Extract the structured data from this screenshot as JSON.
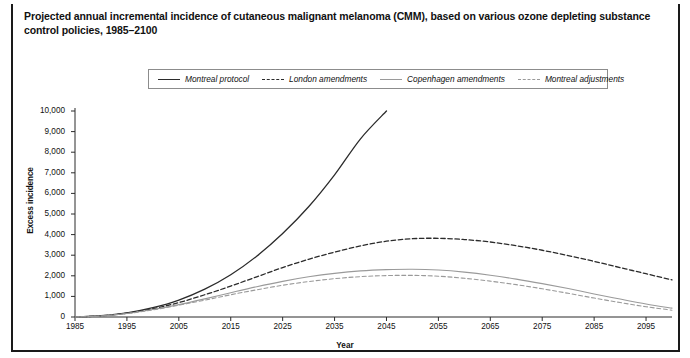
{
  "figure": {
    "title": "Projected annual incremental incidence of cutaneous malignant melanoma (CMM), based on various ozone depleting substance control policies, 1985–2100"
  },
  "chart_data": {
    "type": "line",
    "title": "Projected annual incremental incidence of cutaneous malignant melanoma (CMM), based on various ozone depleting substance control policies, 1985–2100",
    "xlabel": "Year",
    "ylabel": "Excess incidence",
    "xlim": [
      1985,
      2100
    ],
    "ylim": [
      0,
      10000
    ],
    "grid": false,
    "legend_position": "top-center",
    "xticks": [
      1985,
      1995,
      2005,
      2015,
      2025,
      2035,
      2045,
      2055,
      2065,
      2075,
      2085,
      2095
    ],
    "xtick_labels": [
      "1985",
      "1995",
      "2005",
      "2015",
      "2025",
      "2035",
      "2045",
      "2055",
      "2065",
      "2075",
      "2085",
      "2095"
    ],
    "yticks": [
      0,
      1000,
      2000,
      3000,
      4000,
      5000,
      6000,
      7000,
      8000,
      9000,
      10000
    ],
    "ytick_labels": [
      "0",
      "1,000",
      "2,000",
      "3,000",
      "4,000",
      "5,000",
      "6,000",
      "7,000",
      "8,000",
      "9,000",
      "10,000"
    ],
    "x": [
      1985,
      1990,
      1995,
      2000,
      2005,
      2010,
      2015,
      2020,
      2025,
      2030,
      2035,
      2040,
      2045,
      2050,
      2055,
      2060,
      2065,
      2070,
      2075,
      2080,
      2085,
      2090,
      2095,
      2100
    ],
    "series": [
      {
        "name": "Montreal protocol",
        "color": "#2b2b2b",
        "style": "solid",
        "values": [
          0,
          60,
          200,
          450,
          820,
          1350,
          2050,
          2950,
          4050,
          5350,
          6900,
          8650,
          10000,
          null,
          null,
          null,
          null,
          null,
          null,
          null,
          null,
          null,
          null,
          null
        ],
        "note": "rises steeply off-scale, crossing 10,000 near 2042"
      },
      {
        "name": "London amendments",
        "color": "#2b2b2b",
        "style": "dashed",
        "values": [
          0,
          55,
          185,
          400,
          700,
          1080,
          1500,
          1950,
          2400,
          2800,
          3150,
          3450,
          3680,
          3800,
          3820,
          3760,
          3640,
          3460,
          3240,
          2980,
          2700,
          2400,
          2100,
          1800
        ]
      },
      {
        "name": "Copenhagen amendments",
        "color": "#9a9a9a",
        "style": "solid",
        "values": [
          0,
          50,
          170,
          360,
          600,
          880,
          1180,
          1470,
          1730,
          1950,
          2120,
          2240,
          2300,
          2320,
          2280,
          2180,
          2030,
          1840,
          1620,
          1380,
          1120,
          870,
          630,
          430
        ]
      },
      {
        "name": "Montreal adjustments",
        "color": "#9a9a9a",
        "style": "dashed",
        "values": [
          0,
          48,
          165,
          345,
          570,
          820,
          1080,
          1320,
          1540,
          1720,
          1860,
          1960,
          2010,
          2020,
          1980,
          1880,
          1740,
          1570,
          1370,
          1150,
          920,
          700,
          500,
          330
        ]
      }
    ]
  },
  "legend": {
    "items": [
      {
        "label": "Montreal protocol",
        "swatch": "solid-dark"
      },
      {
        "label": "London amendments",
        "swatch": "dash-dark"
      },
      {
        "label": "Copenhagen amendments",
        "swatch": "solid-gray"
      },
      {
        "label": "Montreal adjustments",
        "swatch": "dash-gray"
      }
    ]
  },
  "axes": {
    "y_title": "Excess incidence",
    "x_title": "Year"
  }
}
